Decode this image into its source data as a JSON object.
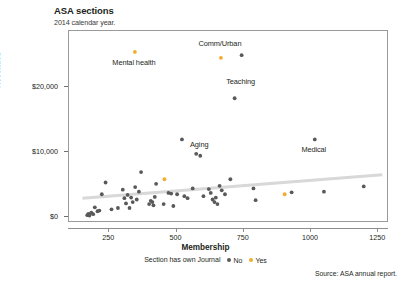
{
  "header": {
    "title": "ASA sections",
    "subtitle": "2014 calendar year."
  },
  "footer": {
    "source": "Source: ASA annual report."
  },
  "legend": {
    "caption": "Section has own Journal",
    "entries": [
      {
        "label": "No",
        "color": "#59595b"
      },
      {
        "label": "Yes",
        "color": "#f0ad2b"
      }
    ]
  },
  "chart_data": {
    "type": "scatter",
    "title": "ASA sections",
    "subtitle": "2014 calendar year.",
    "xlabel": "Membership",
    "ylabel": "Revenues",
    "xlim": [
      100,
      1290
    ],
    "ylim": [
      -900,
      28500
    ],
    "xticks": [
      250,
      500,
      750,
      1000,
      1250
    ],
    "xticklabels": [
      "250",
      "500",
      "750",
      "1000",
      "1250"
    ],
    "yticks": [
      0,
      10000,
      20000
    ],
    "yticklabels": [
      "$0",
      "$10,000",
      "$20,000"
    ],
    "grid": false,
    "legend_position": "bottom",
    "legend_title": "Section has own Journal",
    "colors": {
      "no": "#59595b",
      "yes": "#f0ad2b",
      "trendline": "#d8d8d8",
      "frame": "#9a9a9a"
    },
    "series": [
      {
        "name": "No",
        "color": "#59595b",
        "points": [
          {
            "x": 168,
            "y": 300
          },
          {
            "x": 172,
            "y": 500
          },
          {
            "x": 176,
            "y": 250
          },
          {
            "x": 183,
            "y": 700
          },
          {
            "x": 190,
            "y": 450
          },
          {
            "x": 196,
            "y": 1500
          },
          {
            "x": 206,
            "y": 900
          },
          {
            "x": 213,
            "y": 1000
          },
          {
            "x": 222,
            "y": 3500
          },
          {
            "x": 236,
            "y": 5300
          },
          {
            "x": 258,
            "y": 1200
          },
          {
            "x": 282,
            "y": 1400
          },
          {
            "x": 300,
            "y": 4200
          },
          {
            "x": 306,
            "y": 2900
          },
          {
            "x": 312,
            "y": 2100
          },
          {
            "x": 318,
            "y": 3400
          },
          {
            "x": 325,
            "y": 1400
          },
          {
            "x": 331,
            "y": 3000
          },
          {
            "x": 337,
            "y": 2300
          },
          {
            "x": 346,
            "y": 4600
          },
          {
            "x": 352,
            "y": 2700
          },
          {
            "x": 360,
            "y": 3900
          },
          {
            "x": 368,
            "y": 6900
          },
          {
            "x": 398,
            "y": 2000
          },
          {
            "x": 404,
            "y": 2500
          },
          {
            "x": 410,
            "y": 2300
          },
          {
            "x": 414,
            "y": 1800
          },
          {
            "x": 419,
            "y": 3100
          },
          {
            "x": 424,
            "y": 5100
          },
          {
            "x": 452,
            "y": 2000
          },
          {
            "x": 470,
            "y": 3700
          },
          {
            "x": 480,
            "y": 3600
          },
          {
            "x": 488,
            "y": 1700
          },
          {
            "x": 502,
            "y": 3500
          },
          {
            "x": 520,
            "y": 11900
          },
          {
            "x": 529,
            "y": 3200
          },
          {
            "x": 541,
            "y": 2900
          },
          {
            "x": 560,
            "y": 4400
          },
          {
            "x": 573,
            "y": 9700
          },
          {
            "x": 600,
            "y": 3200
          },
          {
            "x": 620,
            "y": 4300
          },
          {
            "x": 627,
            "y": 3700
          },
          {
            "x": 634,
            "y": 2700
          },
          {
            "x": 641,
            "y": 2300
          },
          {
            "x": 646,
            "y": 3000
          },
          {
            "x": 652,
            "y": 2000
          },
          {
            "x": 660,
            "y": 4800
          },
          {
            "x": 668,
            "y": 4100
          },
          {
            "x": 680,
            "y": 3500
          },
          {
            "x": 700,
            "y": 5800
          },
          {
            "x": 716,
            "y": 18200
          },
          {
            "x": 742,
            "y": 24800
          },
          {
            "x": 786,
            "y": 4400
          },
          {
            "x": 794,
            "y": 2600
          },
          {
            "x": 928,
            "y": 3800
          },
          {
            "x": 1014,
            "y": 11900
          },
          {
            "x": 1048,
            "y": 3900
          },
          {
            "x": 1196,
            "y": 4700
          },
          {
            "x": 588,
            "y": 9400
          }
        ]
      },
      {
        "name": "Yes",
        "color": "#f0ad2b",
        "points": [
          {
            "x": 345,
            "y": 25300
          },
          {
            "x": 455,
            "y": 5800
          },
          {
            "x": 665,
            "y": 24400
          },
          {
            "x": 902,
            "y": 3500
          }
        ]
      }
    ],
    "trendline": {
      "x0": 150,
      "y0": 2900,
      "x1": 1265,
      "y1": 6500,
      "color": "#d8d8d8",
      "width": 3
    },
    "annotations": [
      {
        "text": "Mental health",
        "x": 345,
        "y": 25300,
        "dx": 0,
        "dy": -1800,
        "anchor": "middle"
      },
      {
        "text": "Comm/Urban",
        "x": 665,
        "y": 24400,
        "dx": 0,
        "dy": 1900,
        "anchor": "middle"
      },
      {
        "text": "Teaching",
        "x": 742,
        "y": 24800,
        "dx": 0,
        "dy": -4200,
        "anchor": "middle"
      },
      {
        "text": "Aging",
        "x": 588,
        "y": 9400,
        "dx": 0,
        "dy": 1500,
        "anchor": "middle"
      },
      {
        "text": "Medical",
        "x": 1014,
        "y": 11900,
        "dx": 0,
        "dy": -1700,
        "anchor": "middle"
      }
    ]
  }
}
